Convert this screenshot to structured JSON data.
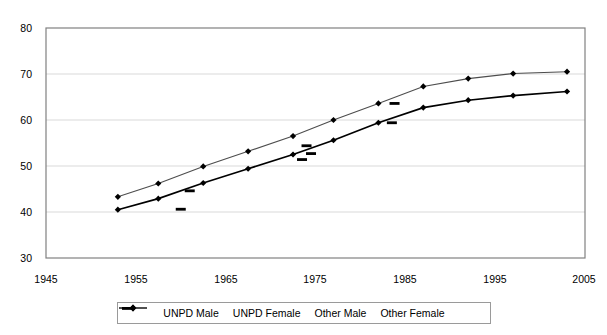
{
  "chart_data": {
    "type": "line",
    "title": "",
    "subtitle": "",
    "xlabel": "",
    "ylabel": "",
    "xlim": [
      1945,
      2005
    ],
    "ylim": [
      30,
      80
    ],
    "xticks": [
      1945,
      1955,
      1965,
      1975,
      1985,
      1995,
      2005
    ],
    "yticks": [
      30,
      40,
      50,
      60,
      70,
      80
    ],
    "grid": "horizontal",
    "legend_position": "bottom",
    "series": [
      {
        "name": "UNPD Male",
        "marker": "diamond",
        "color": "#000000",
        "linestyle": "solid",
        "x": [
          1953,
          1957.5,
          1962.5,
          1967.5,
          1972.5,
          1977,
          1982,
          1987,
          1992,
          1997,
          2003
        ],
        "values": [
          40.5,
          42.9,
          46.3,
          49.4,
          52.5,
          55.6,
          59.4,
          62.7,
          64.3,
          65.3,
          66.2
        ]
      },
      {
        "name": "UNPD Female",
        "marker": "diamond",
        "color": "#4d4d4d",
        "linestyle": "solid",
        "x": [
          1953,
          1957.5,
          1962.5,
          1967.5,
          1972.5,
          1977,
          1982,
          1987,
          1992,
          1997,
          2003
        ],
        "values": [
          43.3,
          46.2,
          49.9,
          53.2,
          56.5,
          60.0,
          63.6,
          67.3,
          69.0,
          70.1,
          70.5
        ]
      },
      {
        "name": "Other Male",
        "marker": "dash",
        "color": "#000000",
        "linestyle": "none",
        "x": [
          1960,
          1973.5,
          1974.5,
          1983.5
        ],
        "values": [
          40.6,
          51.4,
          52.7,
          59.4
        ]
      },
      {
        "name": "Other Female",
        "marker": "dash",
        "color": "#000000",
        "linestyle": "none",
        "x": [
          1961,
          1974,
          1983.8
        ],
        "values": [
          44.6,
          54.4,
          63.6
        ]
      }
    ]
  },
  "axis": {
    "y_tick_labels": [
      "80",
      "70",
      "60",
      "50",
      "40",
      "30"
    ],
    "x_tick_labels": [
      "1945",
      "1955",
      "1965",
      "1975",
      "1985",
      "1995",
      "2005"
    ]
  },
  "legend": {
    "items": [
      {
        "label": "UNPD Male",
        "marker": "line-with-diamond"
      },
      {
        "label": "UNPD Female",
        "marker": "line-with-diamond"
      },
      {
        "label": "Other Male",
        "marker": "dash"
      },
      {
        "label": "Other Female",
        "marker": "dash"
      }
    ]
  }
}
